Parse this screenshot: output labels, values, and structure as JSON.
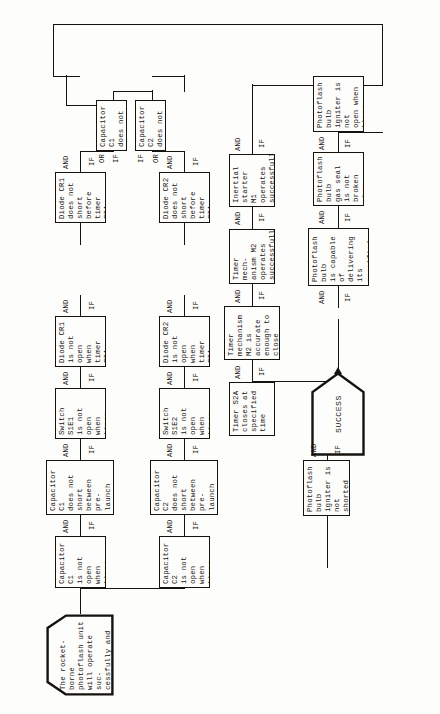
{
  "diagram": {
    "type": "fault-tree",
    "orientation": "rotated-90-ccw",
    "ink_color": "#16130f",
    "paper_color": "#fdfdfc"
  },
  "top_event": {
    "label": "SUCCESS",
    "shape": "home-plate-pentagon"
  },
  "root": {
    "text": "The rocket-borne\nphotoflash unit\nwill operate suc-\ncessfully and with-\nin specified tol-\nerance limits",
    "shape": "pentagon-house"
  },
  "gates": {
    "and": "AND",
    "or": "OR",
    "if": "IF"
  },
  "nodes": [
    {
      "id": "n-cap-c1-open",
      "text": "Capacitor C1\nis not open\nwhen timer\nS2A closes",
      "gate_and": "AND",
      "gate_if": "IF"
    },
    {
      "id": "n-cap-c1-short",
      "text": "Capacitor C1\ndoes not short\nbetween pre-\nlaunch checkout\nand moment S1A\ncloses",
      "gate_and": "AND",
      "gate_if": "IF"
    },
    {
      "id": "n-switch-s1e1",
      "text": "Switch S1E1\nis not open\nwhen timer\nS1A closes",
      "gate_and": "AND",
      "gate_if": "IF"
    },
    {
      "id": "n-diode-cr1-open",
      "text": "Diode CR1\nis not open\nwhen timer\nS2A closes",
      "gate_and": "AND",
      "gate_if": "IF"
    },
    {
      "id": "n-diode-cr1-short",
      "text": "Diode CR1\ndoes not short\nbefore timer\nS2A closes",
      "gate_and": "AND",
      "gate_if": "IF"
    },
    {
      "id": "n-cap-c1-noshort",
      "text": "Capacitor C1\ndoes not short",
      "gate_or": "OR",
      "gate_if": "IF"
    },
    {
      "id": "n-cap-c2-open",
      "text": "Capacitor C2\nis not open\nwhen timer\nS2A closes",
      "gate_and": "AND",
      "gate_if": "IF"
    },
    {
      "id": "n-cap-c2-short",
      "text": "Capacitor C2\ndoes not short\nbetween pre-\nlaunch checkout\nand moment S2A\ncloses",
      "gate_and": "AND",
      "gate_if": "IF"
    },
    {
      "id": "n-switch-s1e2",
      "text": "Switch S1E2\nis not open\nwhen timer\nS2A closes",
      "gate_and": "AND",
      "gate_if": "IF"
    },
    {
      "id": "n-diode-cr2-open",
      "text": "Diode CR2\nis not open\nwhen timer\nS2A closes",
      "gate_and": "AND",
      "gate_if": "IF"
    },
    {
      "id": "n-diode-cr2-short",
      "text": "Diode CR2\ndoes not short\nbefore timer\nS2A closes",
      "gate_and": "AND",
      "gate_if": "IF"
    },
    {
      "id": "n-cap-c2-noshort",
      "text": "Capacitor C2\ndoes not short",
      "gate_or": "OR",
      "gate_if": "IF"
    },
    {
      "id": "n-inertial-m1",
      "text": "Inertial\nstarter M1\noperates\nsuccessfully",
      "gate_and": "AND",
      "gate_if": "IF"
    },
    {
      "id": "n-timer-m2",
      "text": "Timer mech-\nanism M2\noperates\nsuccessfully",
      "gate_and": "AND",
      "gate_if": "IF"
    },
    {
      "id": "n-timer-m2-accurate",
      "text": "Timer mechanism\nM2 is accurate\nenough to close\ntimer S2A at\nspecified time",
      "gate_and": "AND",
      "gate_if": "IF"
    },
    {
      "id": "n-timer-s2a",
      "text": "Timer S2A\ncloses at\nspecified\ntime",
      "gate_and": "AND",
      "gate_if": "IF"
    },
    {
      "id": "n-bulb-igniter-notshorted",
      "text": "Photoflash bulb\nigniter is not\nshorted when\ntimer S2A closes",
      "gate_and": "AND",
      "gate_if": "IF"
    },
    {
      "id": "n-bulb-igniter-notopen",
      "text": "Photoflash bulb\nigniter is not\nopen when timer\ncontact S2A\ncloses",
      "gate_and": "AND",
      "gate_if": "IF"
    },
    {
      "id": "n-bulb-gas-seal",
      "text": "Photoflash bulb\ngas seal is not\nbroken when\ntimer contact\nS2A closes",
      "gate_and": "AND",
      "gate_if": "IF"
    },
    {
      "id": "n-bulb-capable",
      "text": "Photoflash bulb\nis capable of\ndelivering its\nspecified light\nintensity for\nspecified time",
      "gate_and": "AND",
      "gate_if": "IF"
    }
  ]
}
